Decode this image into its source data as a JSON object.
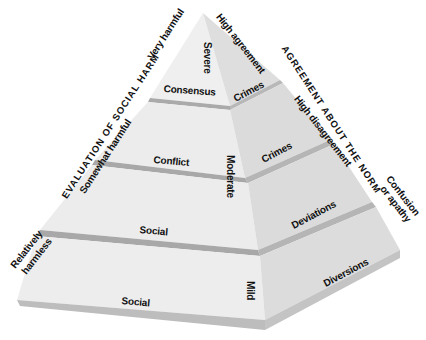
{
  "title_left": "EVALUATION OF SOCIAL HARM",
  "title_right": "AGREEMENT ABOUT THE NORM",
  "harm_levels": {
    "very": "Very harmful",
    "somewhat": "Somewhat harmful",
    "relatively": "Relatively",
    "harmless": "harmless"
  },
  "agreement_levels": {
    "high_agreement": "High agreement",
    "high_disagreement": "High disagreement",
    "confusion": "Confusion",
    "apathy": "or apathy"
  },
  "front_face": [
    "Consensus",
    "Conflict",
    "Social",
    "Social"
  ],
  "edge_labels": [
    "Severe",
    "Moderate",
    "Mild"
  ],
  "right_face": [
    "Crimes",
    "Crimes",
    "Deviations",
    "Diversions"
  ],
  "colors": {
    "face_left": "#ececec",
    "face_right": "#dcdcdc",
    "ledge": "#a8a8a8",
    "text": "#111111"
  }
}
